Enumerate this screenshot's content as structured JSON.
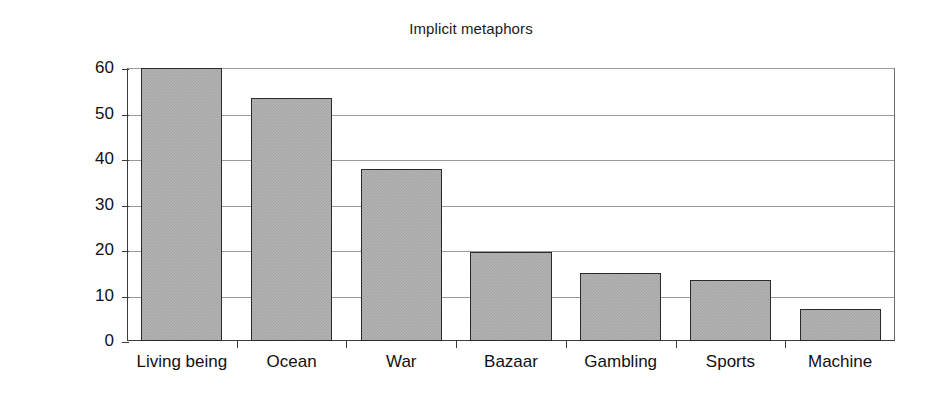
{
  "chart_data": {
    "type": "bar",
    "title": "Implicit metaphors",
    "xlabel": "",
    "ylabel": "Percentage",
    "categories": [
      "Living being",
      "Ocean",
      "War",
      "Bazaar",
      "Gambling",
      "Sports",
      "Machine"
    ],
    "values": [
      60,
      53.5,
      37.8,
      19.5,
      15,
      13.4,
      7
    ],
    "ylim": [
      0,
      60
    ],
    "yticks": [
      0,
      10,
      20,
      30,
      40,
      50,
      60
    ],
    "ytick_labels": [
      "0",
      "10",
      "20",
      "30",
      "40",
      "50",
      "60"
    ],
    "grid": true,
    "legend": false,
    "legend_position": "none",
    "series": [
      {
        "name": "Percentage",
        "values": [
          60,
          53.5,
          37.8,
          19.5,
          15,
          13.4,
          7
        ],
        "color": "#b4b4b4",
        "edge_color": "#2b2b2b"
      }
    ]
  },
  "colors": {
    "background": "#ffffff",
    "bar_fill": "#b4b4b4",
    "bar_edge": "#2b2b2b",
    "gridline": "#9a9a9a",
    "axis": "#3a3a3a",
    "text": "#111111"
  }
}
